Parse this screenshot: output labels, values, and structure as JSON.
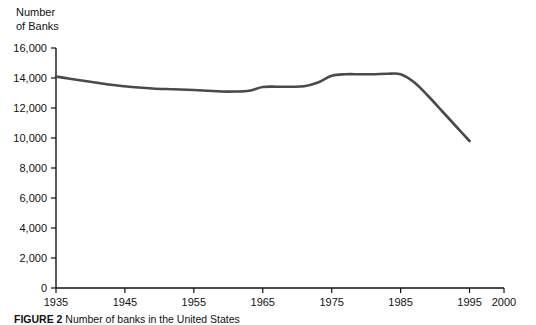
{
  "figure": {
    "caption_label": "FIGURE 2",
    "caption_text": "Number of banks in the United States"
  },
  "chart_data": {
    "type": "line",
    "title": "",
    "ylabel": "Number\nof Banks",
    "xlabel": "",
    "ylim": [
      0,
      16000
    ],
    "xlim": [
      1935,
      2000
    ],
    "grid": false,
    "legend": "none",
    "line_color": "#4a4a4a",
    "ytick_labels": [
      "16,000",
      "14,000",
      "12,000",
      "10,000",
      "8,000",
      "6,000",
      "4,000",
      "2,000",
      "0"
    ],
    "ytick_values": [
      16000,
      14000,
      12000,
      10000,
      8000,
      6000,
      4000,
      2000,
      0
    ],
    "xtick_labels": [
      "1935",
      "1945",
      "1955",
      "1965",
      "1975",
      "1985",
      "1995",
      "2000"
    ],
    "xtick_values": [
      1935,
      1945,
      1955,
      1965,
      1975,
      1985,
      1995,
      2000
    ],
    "series": [
      {
        "name": "Number of Banks",
        "x": [
          1935,
          1937,
          1940,
          1943,
          1946,
          1949,
          1952,
          1955,
          1957,
          1959,
          1961,
          1963,
          1965,
          1967,
          1969,
          1971,
          1973,
          1975,
          1977,
          1979,
          1981,
          1983,
          1985,
          1987,
          1989,
          1991,
          1993,
          1995
        ],
        "values": [
          14100,
          13950,
          13750,
          13550,
          13400,
          13300,
          13250,
          13200,
          13150,
          13100,
          13100,
          13150,
          13400,
          13420,
          13420,
          13450,
          13700,
          14150,
          14250,
          14250,
          14250,
          14280,
          14250,
          13700,
          12800,
          11800,
          10800,
          9800
        ]
      }
    ]
  }
}
